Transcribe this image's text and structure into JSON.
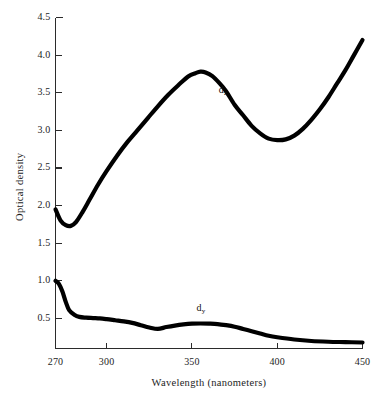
{
  "chart_data": {
    "type": "line",
    "title": "",
    "xlabel": "Wavelength (nanometers)",
    "ylabel": "Optical density",
    "xlim": [
      270,
      450
    ],
    "ylim": [
      0.1,
      4.5
    ],
    "grid": false,
    "legend_position": "inline-annotation",
    "xticks": [
      270,
      300,
      350,
      400,
      450
    ],
    "xtick_labels": [
      "270",
      "300",
      "350",
      "400",
      "450"
    ],
    "yticks": [
      0.5,
      1.0,
      1.5,
      2.0,
      2.5,
      3.0,
      3.5,
      4.0,
      4.5
    ],
    "ytick_labels": [
      "0.5",
      "1.0",
      "1.5",
      "2.0",
      "2.5",
      "3.0",
      "3.5",
      "4.0",
      "4.5"
    ],
    "line_color": "#000000",
    "line_width": 4.2,
    "series": [
      {
        "name": "d_z",
        "label": "d",
        "sublabel": "z",
        "label_x": 368,
        "label_y": 3.52,
        "x": [
          270,
          273,
          276,
          279,
          282,
          286,
          290,
          295,
          300,
          306,
          312,
          318,
          324,
          330,
          336,
          342,
          348,
          352,
          355,
          358,
          362,
          366,
          370,
          375,
          380,
          385,
          390,
          395,
          400,
          405,
          410,
          415,
          420,
          425,
          430,
          435,
          440,
          445,
          450
        ],
        "y": [
          1.95,
          1.8,
          1.74,
          1.73,
          1.78,
          1.92,
          2.08,
          2.28,
          2.46,
          2.66,
          2.84,
          3.0,
          3.16,
          3.32,
          3.47,
          3.6,
          3.72,
          3.76,
          3.78,
          3.77,
          3.72,
          3.63,
          3.52,
          3.34,
          3.2,
          3.06,
          2.96,
          2.89,
          2.87,
          2.88,
          2.93,
          3.02,
          3.14,
          3.28,
          3.44,
          3.62,
          3.8,
          4.0,
          4.2
        ]
      },
      {
        "name": "d_y",
        "label": "d",
        "sublabel": "y",
        "label_x": 355,
        "label_y": 0.63,
        "x": [
          270,
          272,
          274,
          276,
          278,
          281,
          284,
          288,
          292,
          296,
          300,
          305,
          310,
          315,
          320,
          325,
          330,
          335,
          340,
          345,
          350,
          355,
          360,
          365,
          370,
          375,
          380,
          385,
          390,
          395,
          400,
          410,
          420,
          430,
          440,
          450
        ],
        "y": [
          1.0,
          0.96,
          0.86,
          0.72,
          0.61,
          0.55,
          0.52,
          0.51,
          0.505,
          0.5,
          0.49,
          0.475,
          0.46,
          0.44,
          0.41,
          0.38,
          0.36,
          0.385,
          0.405,
          0.42,
          0.43,
          0.432,
          0.43,
          0.425,
          0.41,
          0.39,
          0.36,
          0.33,
          0.3,
          0.27,
          0.25,
          0.22,
          0.2,
          0.19,
          0.185,
          0.18
        ]
      }
    ]
  },
  "axes": {
    "frame_color": "#2b2b2b",
    "tick_direction": "in"
  }
}
